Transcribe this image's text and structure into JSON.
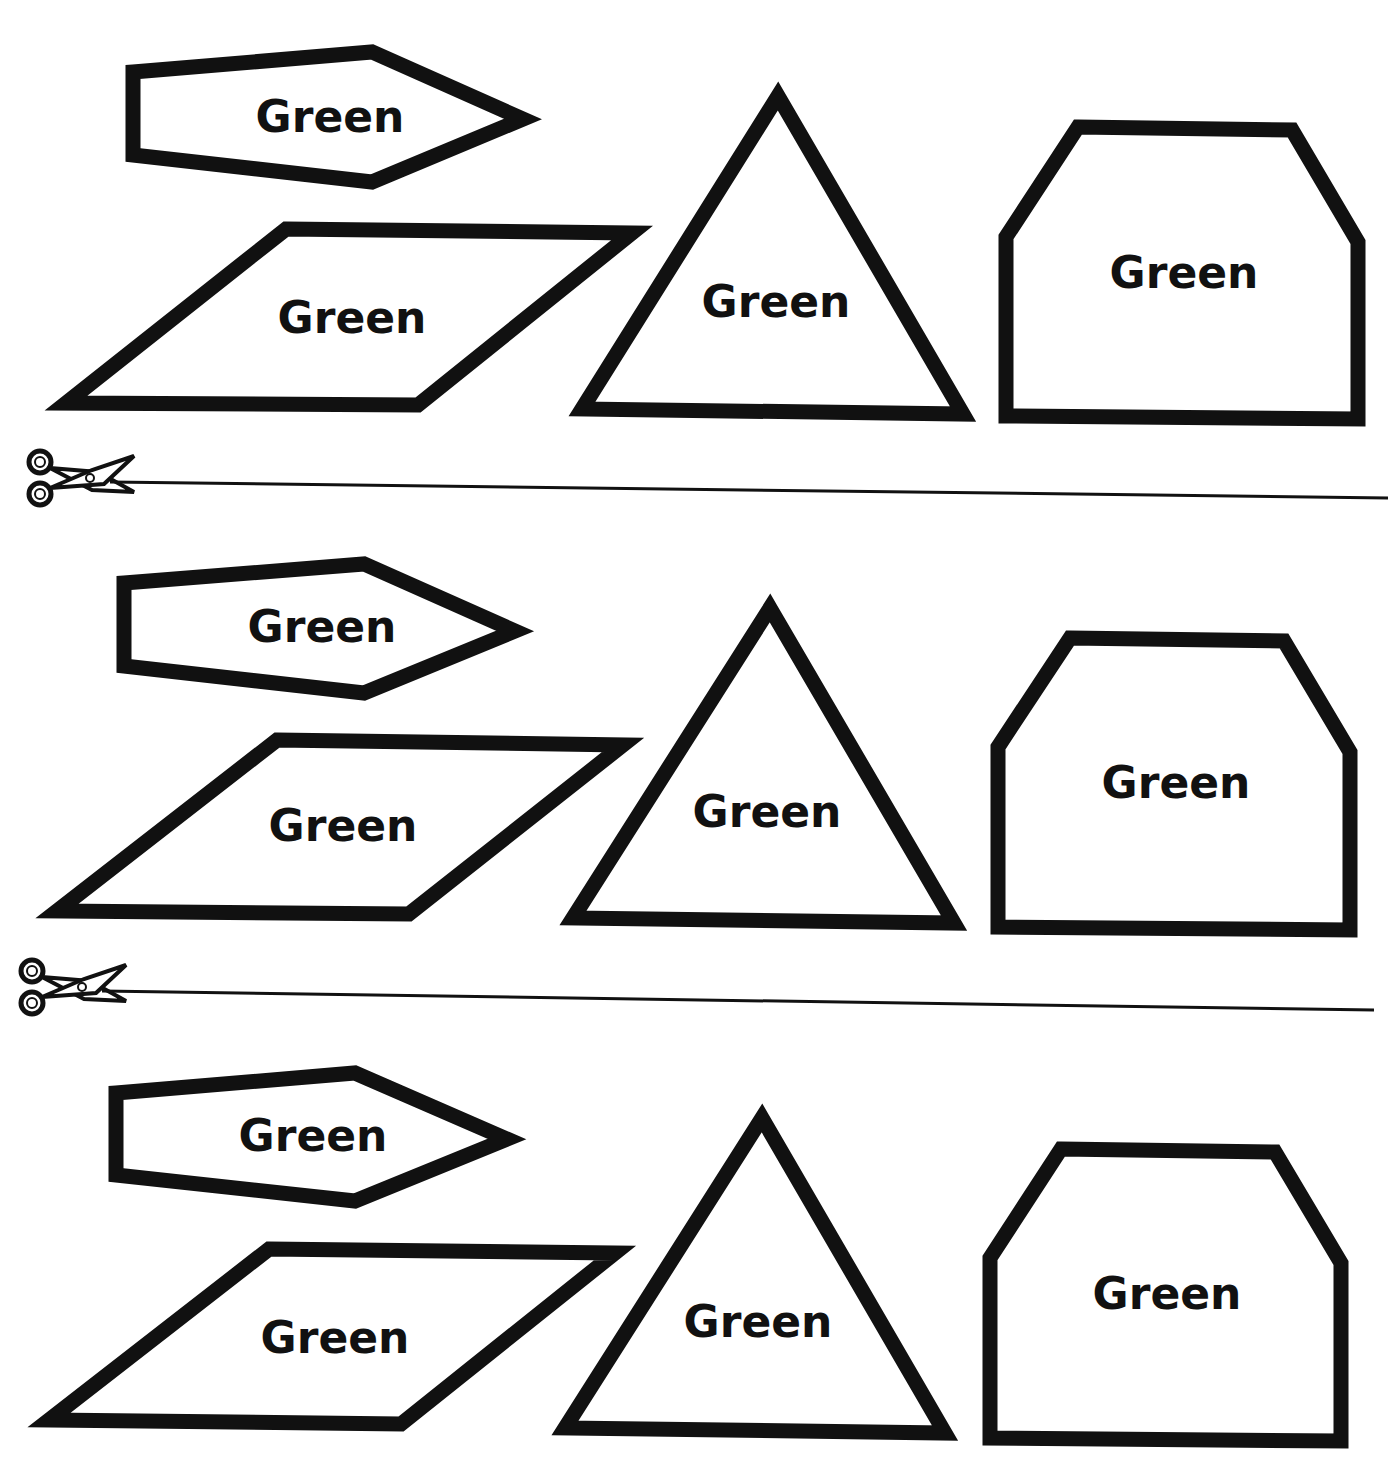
{
  "worksheet": {
    "rows": [
      {
        "shapes": [
          {
            "type": "pentagon",
            "label": "Green"
          },
          {
            "type": "parallelogram",
            "label": "Green"
          },
          {
            "type": "triangle",
            "label": "Green"
          },
          {
            "type": "hexagon",
            "label": "Green"
          }
        ]
      },
      {
        "shapes": [
          {
            "type": "pentagon",
            "label": "Green"
          },
          {
            "type": "parallelogram",
            "label": "Green"
          },
          {
            "type": "triangle",
            "label": "Green"
          },
          {
            "type": "hexagon",
            "label": "Green"
          }
        ]
      },
      {
        "shapes": [
          {
            "type": "pentagon",
            "label": "Green"
          },
          {
            "type": "parallelogram",
            "label": "Green"
          },
          {
            "type": "triangle",
            "label": "Green"
          },
          {
            "type": "hexagon",
            "label": "Green"
          }
        ]
      }
    ],
    "cut_lines": [
      {
        "icon": "scissors-icon"
      },
      {
        "icon": "scissors-icon"
      }
    ],
    "colors": {
      "ink": "#111111",
      "paper": "#ffffff"
    }
  }
}
